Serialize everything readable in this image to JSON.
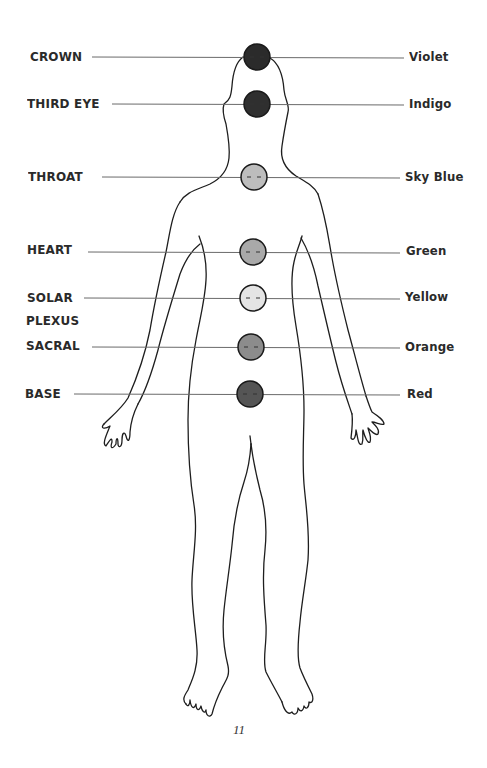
{
  "figure": {
    "page_number": "11"
  },
  "chakras": [
    {
      "name": "CROWN",
      "color_name": "Violet",
      "y": 57,
      "cx": 257,
      "r": 13,
      "fill": "#2b2b2b"
    },
    {
      "name": "THIRD EYE",
      "color_name": "Indigo",
      "y": 104,
      "cx": 257,
      "r": 13,
      "fill": "#2f2f2f"
    },
    {
      "name": "THROAT",
      "color_name": "Sky Blue",
      "y": 177,
      "cx": 254,
      "r": 13,
      "fill": "#bdbdbd"
    },
    {
      "name": "HEART",
      "color_name": "Green",
      "y": 252,
      "cx": 253,
      "r": 13,
      "fill": "#a9a9a9"
    },
    {
      "name": "SOLAR",
      "name_line2": "PLEXUS",
      "color_name": "Yellow",
      "y": 298,
      "cx": 253,
      "r": 13,
      "fill": "#e4e4e4"
    },
    {
      "name": "SACRAL",
      "color_name": "Orange",
      "y": 347,
      "cx": 251,
      "r": 13,
      "fill": "#8c8c8c"
    },
    {
      "name": "BASE",
      "color_name": "Red",
      "y": 394,
      "cx": 250,
      "r": 13,
      "fill": "#555555"
    }
  ],
  "colors": {
    "outline": "#1e1e1e",
    "leader_line": "#6a6a6a",
    "text": "#2a2a2a"
  }
}
